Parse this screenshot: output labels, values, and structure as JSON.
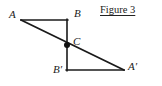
{
  "figure": {
    "caption": "Figure 3",
    "width": 162,
    "height": 86,
    "background_color": "#ffffff",
    "stroke_color": "#1a1a1a",
    "stroke_width": 1.6,
    "point_marker": {
      "name": "point-c-dot",
      "shape": "filled-circle",
      "radius": 3,
      "color": "#111111"
    },
    "points": [
      {
        "id": "A",
        "label": "A",
        "x": 21,
        "y": 20
      },
      {
        "id": "B",
        "label": "B",
        "x": 67,
        "y": 20
      },
      {
        "id": "C",
        "label": "C",
        "x": 67,
        "y": 45
      },
      {
        "id": "Bp",
        "label": "B′",
        "x": 67,
        "y": 70
      },
      {
        "id": "Ap",
        "label": "A′",
        "x": 124,
        "y": 70
      }
    ],
    "segments": [
      {
        "id": "AB",
        "from": "A",
        "to": "B",
        "orientation": "horizontal"
      },
      {
        "id": "BBp",
        "from": "B",
        "to": "Bp",
        "orientation": "vertical"
      },
      {
        "id": "BpAp",
        "from": "Bp",
        "to": "Ap",
        "orientation": "horizontal"
      },
      {
        "id": "AAp",
        "from": "A",
        "to": "Ap",
        "orientation": "diagonal"
      }
    ],
    "labels": {
      "A": "A",
      "B": "B",
      "C": "C",
      "Bp": "B′",
      "Ap": "A′"
    }
  }
}
